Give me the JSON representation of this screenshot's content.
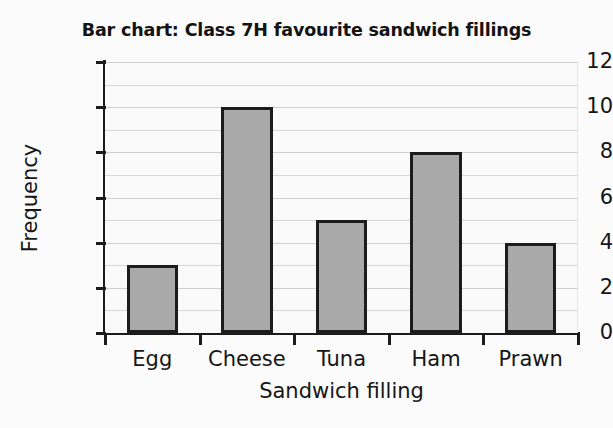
{
  "chart_data": {
    "type": "bar",
    "title": "Bar chart: Class 7H favourite sandwich fillings",
    "xlabel": "Sandwich filling",
    "ylabel": "Frequency",
    "categories": [
      "Egg",
      "Cheese",
      "Tuna",
      "Ham",
      "Prawn"
    ],
    "values": [
      3,
      10,
      5,
      8,
      4
    ],
    "ylim": [
      0,
      12
    ],
    "ytick_labels": [
      "0",
      "2",
      "4",
      "6",
      "8",
      "10",
      "12"
    ],
    "ytick_values": [
      0,
      2,
      4,
      6,
      8,
      10,
      12
    ],
    "minor_gridline_values": [
      1,
      3,
      5,
      7,
      9,
      11
    ],
    "grid": true,
    "legend": false,
    "bar_fill_color": "#a9a9a9",
    "bar_edge_color": "#1c1c1c",
    "axis_color": "#1c1c1c",
    "gridline_color": "#d8d8d8",
    "background_color": "#fbfbfb"
  }
}
